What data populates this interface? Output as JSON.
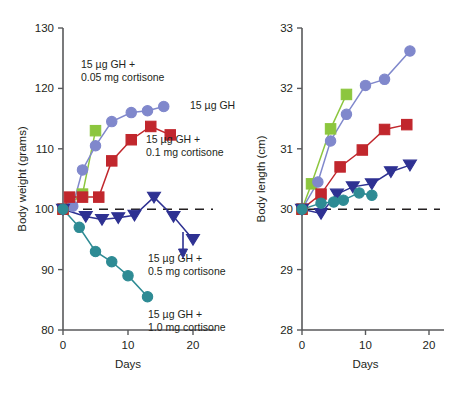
{
  "figure": {
    "panels": [
      "left",
      "right"
    ]
  },
  "chart_data": [
    {
      "type": "line",
      "panel": "left",
      "title": "",
      "xlabel": "Days",
      "ylabel": "Body weight (grams)",
      "xlim": [
        0,
        24
      ],
      "ylim": [
        80,
        130
      ],
      "xticks": [
        0,
        10,
        20
      ],
      "yticks": [
        80,
        90,
        100,
        110,
        120,
        130
      ],
      "grid": false,
      "legend": "inline-annotations",
      "baseline": 100,
      "series": [
        {
          "name": "15 µg GH + 0.05 mg cortisone",
          "color": "#8cc63e",
          "marker": "square",
          "x": [
            0,
            3,
            5
          ],
          "y": [
            100,
            102.5,
            113
          ]
        },
        {
          "name": "15 µg GH",
          "color": "#8088cc",
          "marker": "circle",
          "x": [
            0,
            1.5,
            3,
            5,
            7.5,
            10.5,
            13,
            15.5
          ],
          "y": [
            100,
            100.5,
            106.5,
            110.5,
            114.5,
            116,
            116.3,
            117
          ]
        },
        {
          "name": "15 µg GH + 0.1 mg cortisone",
          "color": "#c1272d",
          "marker": "square",
          "x": [
            0,
            1,
            3,
            5.5,
            7.5,
            10.5,
            13.5,
            16.5
          ],
          "y": [
            100,
            102,
            102,
            102,
            108,
            111.5,
            113.7,
            112.3
          ]
        },
        {
          "name": "15 µg GH + 0.5 mg cortisone",
          "color": "#2e3192",
          "marker": "triangle-down",
          "x": [
            0,
            3.5,
            6,
            8.5,
            11,
            14,
            17,
            20
          ],
          "y": [
            100,
            98.8,
            98.3,
            98.6,
            99,
            102,
            98.8,
            95
          ]
        },
        {
          "name": "15 µg GH + 1.0 mg cortisone",
          "color": "#2e8b94",
          "marker": "circle",
          "x": [
            0,
            2.5,
            5,
            7.5,
            10,
            13
          ],
          "y": [
            100,
            97,
            93,
            91.3,
            89,
            85.5
          ]
        }
      ],
      "annotations": [
        {
          "text_lines": [
            "15 µg GH +",
            "0.05 mg cortisone"
          ],
          "x": 81,
          "y": 68,
          "anchor": "start"
        },
        {
          "text_lines": [
            "15 µg GH"
          ],
          "x": 190,
          "y": 109,
          "anchor": "start"
        },
        {
          "text_lines": [
            "15 µg GH +",
            "0.1 mg cortisone"
          ],
          "x": 146,
          "y": 143,
          "anchor": "start"
        },
        {
          "text_lines": [
            "15 µg GH +",
            "0.5 mg cortisone"
          ],
          "x": 148,
          "y": 262,
          "anchor": "start"
        },
        {
          "text_lines": [
            "15 µg GH +",
            "1.0 mg cortisone"
          ],
          "x": 148,
          "y": 318,
          "anchor": "start"
        }
      ]
    },
    {
      "type": "line",
      "panel": "right",
      "title": "",
      "xlabel": "Days",
      "ylabel": "Body length (cm)",
      "xlim": [
        0,
        24
      ],
      "ylim": [
        28,
        33
      ],
      "xticks": [
        0,
        10,
        20
      ],
      "yticks": [
        28,
        29,
        30,
        31,
        32,
        33
      ],
      "grid": false,
      "legend": "none",
      "baseline": 30,
      "series": [
        {
          "name": "15 µg GH + 0.05 mg cortisone",
          "color": "#8cc63e",
          "marker": "square",
          "x": [
            0,
            1.5,
            4.5,
            7
          ],
          "y": [
            30,
            30.42,
            31.33,
            31.9
          ]
        },
        {
          "name": "15 µg GH",
          "color": "#8088cc",
          "marker": "circle",
          "x": [
            0,
            2.5,
            4.5,
            7,
            10,
            13,
            17
          ],
          "y": [
            30,
            30.45,
            31.13,
            31.57,
            32.05,
            32.15,
            32.62
          ]
        },
        {
          "name": "15 µg GH + 0.1 mg cortisone",
          "color": "#c1272d",
          "marker": "square",
          "x": [
            0,
            3,
            6,
            9.5,
            13,
            16.5
          ],
          "y": [
            30,
            30.25,
            30.7,
            30.98,
            31.32,
            31.4
          ]
        },
        {
          "name": "15 µg GH + 0.5 mg cortisone",
          "color": "#2e3192",
          "marker": "triangle-down",
          "x": [
            0,
            3,
            5.5,
            8,
            11,
            14,
            17
          ],
          "y": [
            30,
            29.93,
            30.25,
            30.37,
            30.42,
            30.62,
            30.73
          ]
        },
        {
          "name": "15 µg GH + 1.0 mg cortisone",
          "color": "#2e8b94",
          "marker": "circle",
          "x": [
            0,
            3,
            5,
            6.5,
            9,
            11
          ],
          "y": [
            30,
            30.1,
            30.12,
            30.15,
            30.27,
            30.23
          ]
        }
      ],
      "annotations": []
    }
  ]
}
